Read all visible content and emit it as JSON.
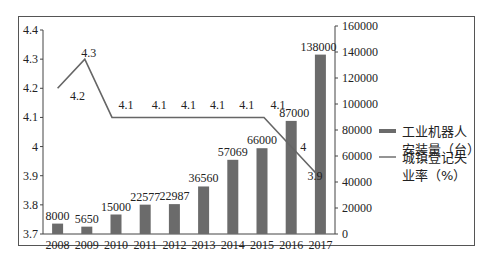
{
  "chart_data": {
    "type": "bar+line",
    "categories": [
      "2008",
      "2009",
      "2010",
      "2011",
      "2012",
      "2013",
      "2014",
      "2015",
      "2016",
      "2017"
    ],
    "series": [
      {
        "name": "工业机器人安装量（台）",
        "type": "bar",
        "axis": "right",
        "values": [
          8000,
          5650,
          15000,
          22577,
          22987,
          36560,
          57069,
          66000,
          87000,
          138000
        ],
        "color": "#6b6b6b"
      },
      {
        "name": "城镇登记失业率（%）",
        "type": "line",
        "axis": "left",
        "values": [
          4.2,
          4.3,
          4.1,
          4.1,
          4.1,
          4.1,
          4.1,
          4.1,
          4.0,
          3.9
        ],
        "color": "#666666"
      }
    ],
    "left_axis": {
      "ticks": [
        "3.7",
        "3.8",
        "3.9",
        "4",
        "4.1",
        "4.2",
        "4.3",
        "4.4"
      ],
      "ylim": [
        3.7,
        4.4
      ]
    },
    "right_axis": {
      "ticks": [
        "0",
        "20000",
        "40000",
        "60000",
        "80000",
        "100000",
        "120000",
        "140000",
        "160000"
      ],
      "ylim": [
        0,
        160000
      ]
    },
    "legend": {
      "position": "right",
      "entries": [
        {
          "line1": "工业机器人",
          "line2": "安装量（台）"
        },
        {
          "line1": "城镇登记失",
          "line2": "业率（%）"
        }
      ]
    },
    "title": "",
    "xlabel": "",
    "ylabel": "",
    "grid": false
  }
}
